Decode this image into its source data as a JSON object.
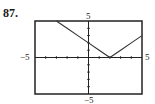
{
  "problem_number": "87.",
  "chart_data": {
    "type": "line",
    "title": "",
    "function": "y = |x - 2|",
    "x": [
      -3,
      -2,
      -1,
      0,
      1,
      2,
      3,
      4,
      5
    ],
    "series": [
      {
        "name": "y",
        "values": [
          5,
          4,
          3,
          2,
          1,
          0,
          1,
          2,
          3
        ]
      }
    ],
    "xlim": [
      -5,
      5
    ],
    "ylim": [
      -5,
      5
    ],
    "xscale_ticks": 1,
    "yscale_ticks": 1,
    "tick_labels": {
      "x_min": "−5",
      "x_max": "5",
      "y_min": "−5",
      "y_max": "5"
    },
    "grid": false,
    "legend": "none"
  },
  "colors": {
    "frame": "#222222",
    "curve": "#333333"
  }
}
